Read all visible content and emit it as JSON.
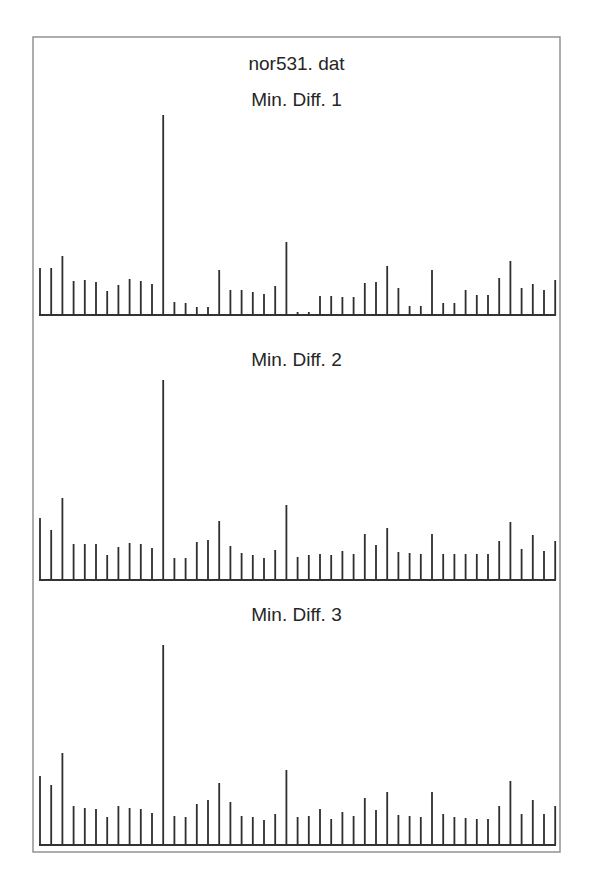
{
  "figure": {
    "file_title": "nor531. dat"
  },
  "chart_data": [
    {
      "type": "bar",
      "suptitle": "nor531. dat",
      "title": "Min. Diff. 1",
      "xlabel": "",
      "ylabel": "",
      "ylim": [
        0,
        200
      ],
      "grid": false,
      "legend": null,
      "values": [
        47,
        47,
        59,
        34,
        35,
        33,
        24,
        30,
        36,
        34,
        31,
        200,
        13,
        12,
        8,
        8,
        45,
        25,
        25,
        23,
        21,
        29,
        73,
        3,
        3,
        19,
        19,
        18,
        18,
        32,
        33,
        49,
        27,
        9,
        9,
        45,
        12,
        12,
        25,
        20,
        20,
        37,
        54,
        27,
        31,
        25,
        35
      ]
    },
    {
      "type": "bar",
      "suptitle": "nor531. dat",
      "title": "Min. Diff. 2",
      "xlabel": "",
      "ylabel": "",
      "ylim": [
        0,
        200
      ],
      "grid": false,
      "legend": null,
      "values": [
        62,
        50,
        82,
        36,
        36,
        36,
        25,
        33,
        37,
        36,
        32,
        200,
        22,
        22,
        38,
        40,
        59,
        34,
        27,
        25,
        22,
        30,
        75,
        23,
        25,
        26,
        25,
        29,
        26,
        46,
        35,
        52,
        28,
        27,
        26,
        46,
        26,
        26,
        26,
        26,
        26,
        39,
        58,
        31,
        45,
        29,
        39
      ]
    },
    {
      "type": "bar",
      "suptitle": "nor531. dat",
      "title": "Min. Diff. 3",
      "xlabel": "",
      "ylabel": "",
      "ylim": [
        0,
        200
      ],
      "grid": false,
      "legend": null,
      "values": [
        69,
        60,
        92,
        39,
        37,
        36,
        28,
        39,
        37,
        36,
        32,
        200,
        29,
        28,
        41,
        45,
        62,
        43,
        29,
        28,
        25,
        31,
        75,
        28,
        29,
        36,
        26,
        33,
        29,
        47,
        35,
        53,
        30,
        29,
        28,
        53,
        31,
        28,
        27,
        26,
        26,
        39,
        64,
        31,
        45,
        31,
        39
      ]
    }
  ]
}
